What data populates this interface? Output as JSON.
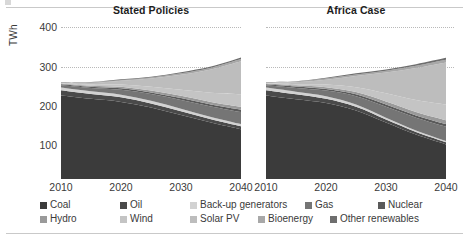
{
  "figure": {
    "y_axis_label": "TWh",
    "y_ticks": [
      "400",
      "300",
      "200",
      "100"
    ],
    "x_ticks": [
      "2010",
      "2020",
      "2030",
      "2040"
    ]
  },
  "panels": [
    {
      "title": "Stated Policies"
    },
    {
      "title": "Africa Case"
    }
  ],
  "legend": {
    "items": [
      {
        "label": "Coal",
        "color": "#3b3b3b"
      },
      {
        "label": "Oil",
        "color": "#4a4a4a"
      },
      {
        "label": "Back-up generators",
        "color": "#d2d2d2"
      },
      {
        "label": "Gas",
        "color": "#757575"
      },
      {
        "label": "Nuclear",
        "color": "#5a5a5a"
      },
      {
        "label": "Hydro",
        "color": "#9a9a9a"
      },
      {
        "label": "Wind",
        "color": "#c4c4c4"
      },
      {
        "label": "Solar PV",
        "color": "#bdbdbd"
      },
      {
        "label": "Bioenergy",
        "color": "#a8a8a8"
      },
      {
        "label": "Other renewables",
        "color": "#6e6e6e"
      }
    ]
  },
  "chart_data": {
    "type": "area",
    "xlabel": "",
    "ylabel": "TWh",
    "ylim": [
      0,
      420
    ],
    "xlim": [
      2010,
      2040
    ],
    "grid": "horizontal-dotted",
    "legend_position": "bottom",
    "stacked": true,
    "x": [
      2010,
      2015,
      2020,
      2025,
      2030,
      2035,
      2040
    ],
    "panels": [
      {
        "name": "Stated Policies",
        "series": [
          {
            "name": "Coal",
            "color": "#3b3b3b",
            "values": [
              222,
              213,
              205,
              190,
              170,
              150,
              132
            ]
          },
          {
            "name": "Oil",
            "color": "#4a4a4a",
            "values": [
              14,
              13,
              12,
              11,
              10,
              9,
              8
            ]
          },
          {
            "name": "Back-up generators",
            "color": "#d2d2d2",
            "values": [
              7,
              7,
              7,
              7,
              7,
              6,
              6
            ]
          },
          {
            "name": "Gas",
            "color": "#757575",
            "values": [
              6,
              9,
              13,
              18,
              23,
              28,
              32
            ]
          },
          {
            "name": "Nuclear",
            "color": "#5a5a5a",
            "values": [
              3,
              3,
              4,
              4,
              5,
              5,
              6
            ]
          },
          {
            "name": "Hydro",
            "color": "#9a9a9a",
            "values": [
              2,
              3,
              4,
              5,
              6,
              7,
              8
            ]
          },
          {
            "name": "Wind",
            "color": "#c4c4c4",
            "values": [
              1,
              3,
              6,
              10,
              16,
              24,
              33
            ]
          },
          {
            "name": "Solar PV",
            "color": "#bdbdbd",
            "values": [
              1,
              4,
              10,
              22,
              40,
              62,
              88
            ]
          },
          {
            "name": "Bioenergy",
            "color": "#a8a8a8",
            "values": [
              1,
              2,
              2,
              3,
              4,
              5,
              6
            ]
          },
          {
            "name": "Other renewables",
            "color": "#6e6e6e",
            "values": [
              1,
              1,
              2,
              2,
              3,
              3,
              4
            ]
          }
        ],
        "totals": [
          258,
          258,
          265,
          272,
          284,
          299,
          323
        ]
      },
      {
        "name": "Africa Case",
        "series": [
          {
            "name": "Coal",
            "color": "#3b3b3b",
            "values": [
              222,
              212,
              202,
              182,
              150,
              118,
              92
            ]
          },
          {
            "name": "Oil",
            "color": "#4a4a4a",
            "values": [
              14,
              13,
              11,
              10,
              8,
              7,
              6
            ]
          },
          {
            "name": "Back-up generators",
            "color": "#d2d2d2",
            "values": [
              7,
              7,
              7,
              6,
              5,
              4,
              3
            ]
          },
          {
            "name": "Gas",
            "color": "#757575",
            "values": [
              6,
              10,
              15,
              22,
              29,
              34,
              38
            ]
          },
          {
            "name": "Nuclear",
            "color": "#5a5a5a",
            "values": [
              3,
              4,
              4,
              5,
              6,
              6,
              7
            ]
          },
          {
            "name": "Hydro",
            "color": "#9a9a9a",
            "values": [
              2,
              3,
              5,
              6,
              8,
              9,
              10
            ]
          },
          {
            "name": "Wind",
            "color": "#c4c4c4",
            "values": [
              1,
              3,
              7,
              13,
              22,
              32,
              42
            ]
          },
          {
            "name": "Solar PV",
            "color": "#bdbdbd",
            "values": [
              1,
              5,
              13,
              30,
              55,
              85,
              112
            ]
          },
          {
            "name": "Bioenergy",
            "color": "#a8a8a8",
            "values": [
              1,
              2,
              3,
              4,
              5,
              6,
              7
            ]
          },
          {
            "name": "Other renewables",
            "color": "#6e6e6e",
            "values": [
              1,
              1,
              2,
              3,
              3,
              4,
              5
            ]
          }
        ],
        "totals": [
          258,
          260,
          269,
          281,
          291,
          305,
          322
        ]
      }
    ]
  }
}
